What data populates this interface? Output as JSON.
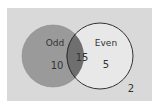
{
  "diagram": {
    "type": "venn",
    "sets": [
      {
        "name": "Odd",
        "only_count": "10",
        "color": "#9a9a9a"
      },
      {
        "name": "Even",
        "only_count": "5",
        "color": "#e6e6e6"
      }
    ],
    "intersection_count": "15",
    "outside_count": "2",
    "colors": {
      "background": "#d9d9d9",
      "odd_fill": "#9a9a9a",
      "even_fill": "#e8e8e8",
      "intersection_fill": "#6f6f6f",
      "outline": "#333333"
    }
  }
}
